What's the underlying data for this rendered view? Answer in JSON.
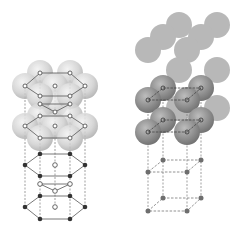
{
  "figure": {
    "panels": [
      {
        "id": "hcp",
        "label": "Hexagonal close-packed lattice"
      },
      {
        "id": "cubic",
        "label": "Simple cubic lattice"
      }
    ],
    "colors": {
      "background": "#ffffff",
      "sphere_light": "#d4d4d4",
      "sphere_dark": "#9a9a9a",
      "sphere_flat": "#a9a9a9",
      "atom_filled": "#333333",
      "atom_open": "#ffffff",
      "bond_line": "#555555",
      "dashed_line": "#777777"
    }
  }
}
